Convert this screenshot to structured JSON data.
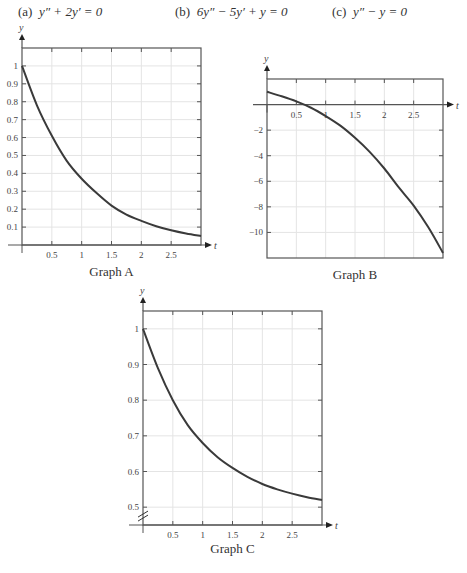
{
  "equations": [
    {
      "label": "(a)",
      "text": "y″ + 2y′ = 0"
    },
    {
      "label": "(b)",
      "text": "6y″ − 5y′ + y = 0"
    },
    {
      "label": "(c)",
      "text": "y″ − y = 0"
    }
  ],
  "colors": {
    "curve": "#3a3a3a",
    "frame": "#555555",
    "grid": "#e4e4e4"
  },
  "chart_data": [
    {
      "type": "line",
      "title": "Graph A",
      "xlabel": "t",
      "ylabel": "y",
      "xlim": [
        0,
        3
      ],
      "ylim": [
        0,
        1.1
      ],
      "xticks": [
        "0.5",
        "1",
        "1.5",
        "2",
        "2.5"
      ],
      "yticks": [
        "0.1",
        "0.2",
        "0.3",
        "0.4",
        "0.5",
        "0.6",
        "0.7",
        "0.8",
        "0.9",
        "1"
      ],
      "grid": true,
      "series": [
        {
          "name": "y(t)",
          "x": [
            0,
            0.25,
            0.5,
            0.75,
            1,
            1.25,
            1.5,
            1.75,
            2,
            2.25,
            2.5,
            2.75,
            3
          ],
          "values": [
            1.0,
            0.78,
            0.61,
            0.47,
            0.37,
            0.29,
            0.22,
            0.17,
            0.135,
            0.105,
            0.082,
            0.064,
            0.05
          ]
        }
      ]
    },
    {
      "type": "line",
      "title": "Graph B",
      "xlabel": "t",
      "ylabel": "y",
      "xlim": [
        0,
        3
      ],
      "ylim": [
        -12,
        2
      ],
      "xticks": [
        "0.5",
        "1",
        "1.5",
        "2",
        "2.5"
      ],
      "yticks": [
        "-2",
        "-4",
        "-6",
        "-8",
        "-10"
      ],
      "grid": true,
      "series": [
        {
          "name": "y(t)",
          "x": [
            0,
            0.25,
            0.5,
            0.75,
            1,
            1.25,
            1.5,
            1.75,
            2,
            2.25,
            2.5,
            2.75,
            3
          ],
          "values": [
            1.0,
            0.65,
            0.25,
            -0.25,
            -0.9,
            -1.65,
            -2.6,
            -3.7,
            -5.0,
            -6.5,
            -7.9,
            -9.6,
            -11.6
          ]
        }
      ]
    },
    {
      "type": "line",
      "title": "Graph C",
      "xlabel": "t",
      "ylabel": "y",
      "xlim": [
        0,
        3
      ],
      "ylim": [
        0.45,
        1.05
      ],
      "xticks": [
        "0.5",
        "1",
        "1.5",
        "2",
        "2.5"
      ],
      "yticks": [
        "0.5",
        "0.6",
        "0.7",
        "0.8",
        "0.9",
        "1"
      ],
      "grid": true,
      "axis_break": true,
      "series": [
        {
          "name": "y(t)",
          "x": [
            0,
            0.25,
            0.5,
            0.75,
            1,
            1.25,
            1.5,
            1.75,
            2,
            2.25,
            2.5,
            2.75,
            3
          ],
          "values": [
            1.0,
            0.89,
            0.8,
            0.73,
            0.68,
            0.64,
            0.61,
            0.585,
            0.565,
            0.55,
            0.538,
            0.528,
            0.52
          ]
        }
      ]
    }
  ]
}
